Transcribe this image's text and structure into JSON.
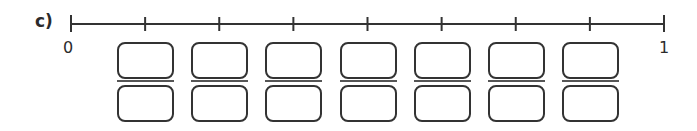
{
  "exercise": {
    "label": "c)",
    "number_line": {
      "start_label": "0",
      "end_label": "1",
      "start_x": 71,
      "end_x": 664,
      "divisions": 8,
      "line_y": 24,
      "color": "#333333"
    },
    "fraction_boxes": [
      {
        "index": 1,
        "numerator": "",
        "denominator": ""
      },
      {
        "index": 2,
        "numerator": "",
        "denominator": ""
      },
      {
        "index": 3,
        "numerator": "",
        "denominator": ""
      },
      {
        "index": 4,
        "numerator": "",
        "denominator": ""
      },
      {
        "index": 5,
        "numerator": "",
        "denominator": ""
      },
      {
        "index": 6,
        "numerator": "",
        "denominator": ""
      },
      {
        "index": 7,
        "numerator": "",
        "denominator": ""
      }
    ]
  }
}
